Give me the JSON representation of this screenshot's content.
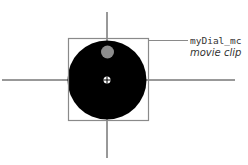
{
  "diagram": {
    "label_name": "myDial_mc",
    "label_type": "movie clip",
    "colors": {
      "axis": "#333333",
      "bounding_box": "#888888",
      "dial": "#000000",
      "indicator_dot": "#888888",
      "registration_mark": "#ffffff"
    }
  }
}
